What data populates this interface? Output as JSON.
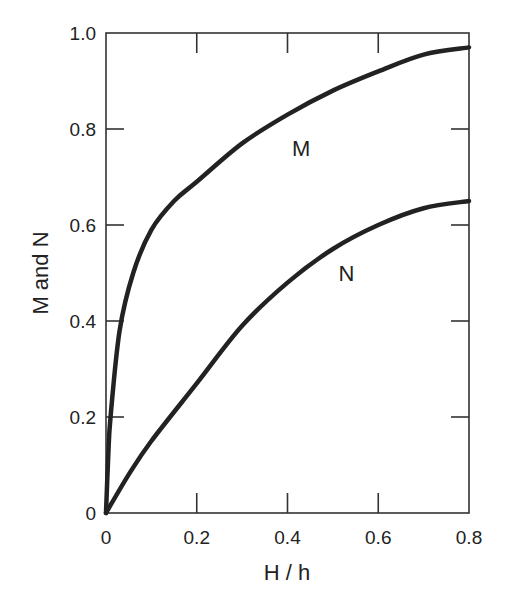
{
  "chart_data": {
    "type": "line",
    "title": "",
    "xlabel": "H / h",
    "ylabel": "M and N",
    "xlim": [
      0,
      0.8
    ],
    "ylim": [
      0,
      1.0
    ],
    "grid": false,
    "legend": "none (curves labeled directly)",
    "x_ticks": [
      "0",
      "0.2",
      "0.4",
      "0.6",
      "0.8"
    ],
    "y_ticks": [
      "0",
      "0.2",
      "0.4",
      "0.6",
      "0.8",
      "1.0"
    ],
    "series": [
      {
        "name": "M",
        "x": [
          0,
          0.005,
          0.01,
          0.03,
          0.06,
          0.1,
          0.15,
          0.2,
          0.3,
          0.4,
          0.5,
          0.6,
          0.7,
          0.8
        ],
        "values": [
          0,
          0.12,
          0.2,
          0.38,
          0.5,
          0.59,
          0.65,
          0.69,
          0.77,
          0.83,
          0.88,
          0.92,
          0.955,
          0.97
        ]
      },
      {
        "name": "N",
        "x": [
          0,
          0.05,
          0.1,
          0.2,
          0.3,
          0.4,
          0.5,
          0.6,
          0.7,
          0.8
        ],
        "values": [
          0,
          0.08,
          0.15,
          0.27,
          0.39,
          0.48,
          0.55,
          0.6,
          0.635,
          0.65
        ]
      }
    ],
    "annotations": [
      {
        "text": "M",
        "x": 0.43,
        "y": 0.76
      },
      {
        "text": "N",
        "x": 0.53,
        "y": 0.5
      }
    ]
  }
}
